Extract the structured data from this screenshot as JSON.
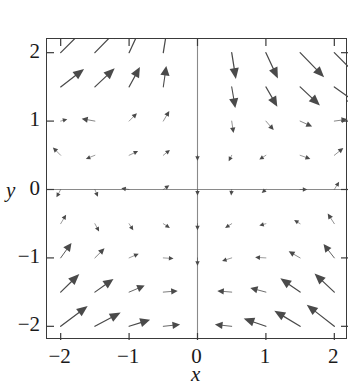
{
  "chart_data": {
    "type": "scatter",
    "subtype": "vector-field",
    "title": "",
    "xlabel": "x",
    "ylabel": "y",
    "xlim": [
      -2.2,
      2.2
    ],
    "ylim": [
      -2.2,
      2.2
    ],
    "xticks": [
      -2,
      -1,
      0,
      1,
      2
    ],
    "yticks": [
      -2,
      -1,
      0,
      1,
      2
    ],
    "xtick_labels": [
      "−2",
      "−1",
      "0",
      "1",
      "2"
    ],
    "ytick_labels": [
      "−2",
      "−1",
      "0",
      "1",
      "2"
    ],
    "grid": false,
    "legend": "none",
    "axes_through_origin": true,
    "frame": true,
    "arrow_color": "#4a4a4a",
    "axis_color": "#8a8a8a",
    "frame_color": "#3a3a3a",
    "background": "#ffffff",
    "grid_spacing": 0.5,
    "grid_x": [
      -2,
      -1.5,
      -1,
      -0.5,
      0,
      0.5,
      1,
      1.5,
      2
    ],
    "grid_y": [
      -2,
      -1.5,
      -1,
      -0.5,
      0,
      0.5,
      1,
      1.5,
      2
    ],
    "field_description": "Clockwise circulation / rotational direction field; arrow length grows with distance from the origin and arrows are nearly zero near the origin.",
    "vectors": [
      {
        "x": -2.0,
        "y": 2.0,
        "u": 0.92,
        "v": 0.92
      },
      {
        "x": -1.5,
        "y": 2.0,
        "u": 0.8,
        "v": 0.82
      },
      {
        "x": -1.0,
        "y": 2.0,
        "u": 0.4,
        "v": 0.86
      },
      {
        "x": -0.5,
        "y": 2.0,
        "u": 0.14,
        "v": 0.88
      },
      {
        "x": 0.0,
        "y": 2.0,
        "u": 0.0,
        "v": 0.0
      },
      {
        "x": 0.5,
        "y": 2.0,
        "u": 0.14,
        "v": -0.88
      },
      {
        "x": 1.0,
        "y": 2.0,
        "u": 0.4,
        "v": -0.86
      },
      {
        "x": 1.5,
        "y": 2.0,
        "u": 0.8,
        "v": -0.82
      },
      {
        "x": 2.0,
        "y": 2.0,
        "u": 0.92,
        "v": -0.92
      },
      {
        "x": -2.0,
        "y": 1.5,
        "u": 0.78,
        "v": 0.6
      },
      {
        "x": -1.5,
        "y": 1.5,
        "u": 0.66,
        "v": 0.62
      },
      {
        "x": -1.0,
        "y": 1.5,
        "u": 0.36,
        "v": 0.66
      },
      {
        "x": -0.5,
        "y": 1.5,
        "u": 0.1,
        "v": 0.7
      },
      {
        "x": 0.0,
        "y": 1.5,
        "u": 0.0,
        "v": 0.0
      },
      {
        "x": 0.5,
        "y": 1.5,
        "u": 0.12,
        "v": -0.7
      },
      {
        "x": 1.0,
        "y": 1.5,
        "u": 0.38,
        "v": -0.66
      },
      {
        "x": 1.5,
        "y": 1.5,
        "u": 0.66,
        "v": -0.62
      },
      {
        "x": 2.0,
        "y": 1.5,
        "u": 0.8,
        "v": -0.58
      },
      {
        "x": -2.0,
        "y": 1.0,
        "u": 0.22,
        "v": 0.06
      },
      {
        "x": -1.5,
        "y": 1.0,
        "u": -0.44,
        "v": 0.08
      },
      {
        "x": -1.0,
        "y": 1.0,
        "u": 0.26,
        "v": 0.26
      },
      {
        "x": -0.5,
        "y": 1.0,
        "u": 0.2,
        "v": 0.34
      },
      {
        "x": 0.0,
        "y": 1.0,
        "u": 0.0,
        "v": 0.0
      },
      {
        "x": 0.5,
        "y": 1.0,
        "u": 0.06,
        "v": -0.4
      },
      {
        "x": 1.0,
        "y": 1.0,
        "u": 0.26,
        "v": -0.3
      },
      {
        "x": 1.5,
        "y": 1.0,
        "u": 0.4,
        "v": -0.18
      },
      {
        "x": 2.0,
        "y": 1.0,
        "u": 0.44,
        "v": 0.06
      },
      {
        "x": -2.0,
        "y": 0.5,
        "u": -0.26,
        "v": 0.26
      },
      {
        "x": -1.5,
        "y": 0.5,
        "u": -0.3,
        "v": -0.12
      },
      {
        "x": -1.0,
        "y": 0.5,
        "u": 0.3,
        "v": 0.14
      },
      {
        "x": -0.5,
        "y": 0.5,
        "u": 0.22,
        "v": 0.18
      },
      {
        "x": 0.0,
        "y": 0.5,
        "u": 0.0,
        "v": -0.18
      },
      {
        "x": 0.5,
        "y": 0.5,
        "u": -0.1,
        "v": -0.2
      },
      {
        "x": 1.0,
        "y": 0.5,
        "u": -0.22,
        "v": -0.14
      },
      {
        "x": 1.5,
        "y": 0.5,
        "u": 0.34,
        "v": -0.12
      },
      {
        "x": 2.0,
        "y": 0.5,
        "u": 0.3,
        "v": 0.24
      },
      {
        "x": -2.0,
        "y": 0.0,
        "u": -0.14,
        "v": -0.26
      },
      {
        "x": -1.5,
        "y": 0.0,
        "u": 0.1,
        "v": -0.24
      },
      {
        "x": -1.0,
        "y": 0.0,
        "u": -0.26,
        "v": 0.04
      },
      {
        "x": -0.5,
        "y": 0.0,
        "u": 0.2,
        "v": 0.14
      },
      {
        "x": 0.0,
        "y": 0.0,
        "u": 0.0,
        "v": -0.2
      },
      {
        "x": 0.5,
        "y": 0.0,
        "u": -0.02,
        "v": -0.2
      },
      {
        "x": 1.0,
        "y": 0.0,
        "u": -0.14,
        "v": -0.12
      },
      {
        "x": 1.5,
        "y": 0.0,
        "u": 0.24,
        "v": 0.0
      },
      {
        "x": 2.0,
        "y": 0.0,
        "u": 0.16,
        "v": 0.26
      },
      {
        "x": -2.0,
        "y": -0.5,
        "u": 0.18,
        "v": 0.3
      },
      {
        "x": -1.5,
        "y": -0.5,
        "u": 0.14,
        "v": -0.26
      },
      {
        "x": -1.0,
        "y": -0.5,
        "u": 0.14,
        "v": -0.22
      },
      {
        "x": -0.5,
        "y": -0.5,
        "u": 0.22,
        "v": -0.14
      },
      {
        "x": 0.0,
        "y": -0.5,
        "u": 0.0,
        "v": -0.22
      },
      {
        "x": 0.5,
        "y": -0.5,
        "u": -0.22,
        "v": -0.14
      },
      {
        "x": 1.0,
        "y": -0.5,
        "u": -0.22,
        "v": -0.06
      },
      {
        "x": 1.5,
        "y": -0.5,
        "u": -0.2,
        "v": 0.12
      },
      {
        "x": 2.0,
        "y": -0.5,
        "u": -0.22,
        "v": 0.34
      },
      {
        "x": -2.0,
        "y": -1.0,
        "u": 0.36,
        "v": 0.5
      },
      {
        "x": -1.5,
        "y": -1.0,
        "u": 0.32,
        "v": 0.32
      },
      {
        "x": -1.0,
        "y": -1.0,
        "u": 0.32,
        "v": 0.14
      },
      {
        "x": -0.5,
        "y": -1.0,
        "u": 0.34,
        "v": -0.02
      },
      {
        "x": 0.0,
        "y": -1.0,
        "u": 0.0,
        "v": -0.26
      },
      {
        "x": 0.5,
        "y": -1.0,
        "u": -0.32,
        "v": -0.1
      },
      {
        "x": 1.0,
        "y": -1.0,
        "u": -0.36,
        "v": 0.02
      },
      {
        "x": 1.5,
        "y": -1.0,
        "u": -0.38,
        "v": 0.22
      },
      {
        "x": 2.0,
        "y": -1.0,
        "u": -0.36,
        "v": 0.46
      },
      {
        "x": -2.0,
        "y": -1.5,
        "u": 0.62,
        "v": 0.6
      },
      {
        "x": -1.5,
        "y": -1.5,
        "u": 0.62,
        "v": 0.44
      },
      {
        "x": -1.0,
        "y": -1.5,
        "u": 0.52,
        "v": 0.22
      },
      {
        "x": -0.5,
        "y": -1.5,
        "u": 0.48,
        "v": 0.04
      },
      {
        "x": 0.0,
        "y": -1.5,
        "u": 0.0,
        "v": 0.0
      },
      {
        "x": 0.5,
        "y": -1.5,
        "u": -0.48,
        "v": 0.04
      },
      {
        "x": 1.0,
        "y": -1.5,
        "u": -0.52,
        "v": 0.14
      },
      {
        "x": 1.5,
        "y": -1.5,
        "u": -0.66,
        "v": 0.46
      },
      {
        "x": 2.0,
        "y": -1.5,
        "u": -0.66,
        "v": 0.62
      },
      {
        "x": -2.0,
        "y": -2.0,
        "u": 0.9,
        "v": 0.68
      },
      {
        "x": -1.5,
        "y": -2.0,
        "u": 0.86,
        "v": 0.46
      },
      {
        "x": -1.0,
        "y": -2.0,
        "u": 0.7,
        "v": 0.22
      },
      {
        "x": -0.5,
        "y": -2.0,
        "u": 0.56,
        "v": 0.06
      },
      {
        "x": 0.0,
        "y": -2.0,
        "u": 0.0,
        "v": 0.0
      },
      {
        "x": 0.5,
        "y": -2.0,
        "u": -0.56,
        "v": 0.06
      },
      {
        "x": 1.0,
        "y": -2.0,
        "u": -0.74,
        "v": 0.26
      },
      {
        "x": 1.5,
        "y": -2.0,
        "u": -0.86,
        "v": 0.52
      },
      {
        "x": 2.0,
        "y": -2.0,
        "u": -0.92,
        "v": 0.72
      }
    ]
  },
  "axes": {
    "x_label": "x",
    "y_label": "y",
    "x_tick_labels": [
      "−2",
      "−1",
      "0",
      "1",
      "2"
    ],
    "y_tick_labels": [
      "2",
      "1",
      "0",
      "−1",
      "−2"
    ]
  }
}
